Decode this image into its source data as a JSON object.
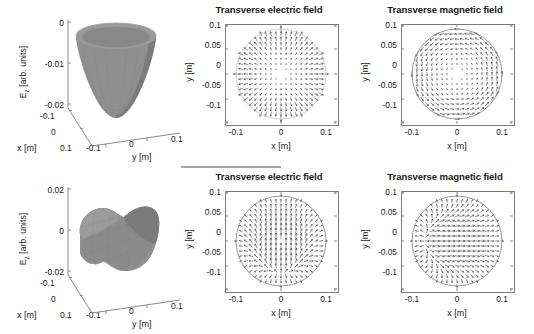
{
  "figure": {
    "background": "#ffffff",
    "surface_color": "#8c8c8c",
    "arrow_color": "#4d4d4d",
    "axis_color": "#7a7a7a"
  },
  "panels": [
    {
      "id": "tm01-ez-surface",
      "kind": "surface3d",
      "zlabel_main": "E",
      "zlabel_sub": "z",
      "zlabel_tail": " [arb. units]",
      "xlabel": "x [m]",
      "ylabel": "y [m]",
      "zticks": [
        "0",
        "-0.01",
        "-0.02"
      ],
      "xticks": [
        "-0.1",
        "0",
        "0.1"
      ],
      "yticks": [
        "-0.1",
        "0",
        "0.1"
      ],
      "shape": "bowl"
    },
    {
      "id": "tm01-transverse-electric",
      "kind": "quiver",
      "title": "Transverse electric field",
      "xlabel": "x [m]",
      "ylabel": "y [m]",
      "yticks": [
        "0.1",
        "0.05",
        "0",
        "-0.05",
        "-0.1"
      ],
      "xticks": [
        "-0.1",
        "0",
        "0.1"
      ],
      "pattern": "radial"
    },
    {
      "id": "tm01-transverse-magnetic",
      "kind": "quiver",
      "title": "Transverse magnetic field",
      "xlabel": "x [m]",
      "ylabel": "y [m]",
      "yticks": [
        "0.1",
        "0.05",
        "0",
        "-0.05",
        "-0.1"
      ],
      "xticks": [
        "-0.1",
        "0",
        "0.1"
      ],
      "pattern": "azimuthal"
    },
    {
      "id": "tm11-ez-surface",
      "kind": "surface3d",
      "zlabel_main": "E",
      "zlabel_sub": "z",
      "zlabel_tail": " [arb. units]",
      "xlabel": "x [m]",
      "ylabel": "y [m]",
      "zticks": [
        "0.02",
        "0",
        "-0.02"
      ],
      "xticks": [
        "-0.1",
        "0",
        "0.1"
      ],
      "yticks": [
        "-0.1",
        "0",
        "0.1"
      ],
      "shape": "saddle"
    },
    {
      "id": "tm11-transverse-electric",
      "kind": "quiver",
      "title": "Transverse electric field",
      "xlabel": "x [m]",
      "ylabel": "y [m]",
      "yticks": [
        "0.1",
        "0.05",
        "0",
        "-0.05",
        "-0.1"
      ],
      "xticks": [
        "-0.1",
        "0",
        "0.1"
      ],
      "pattern": "vertical-dipole"
    },
    {
      "id": "tm11-transverse-magnetic",
      "kind": "quiver",
      "title": "Transverse magnetic field",
      "xlabel": "x [m]",
      "ylabel": "y [m]",
      "yticks": [
        "0.1",
        "0.05",
        "0",
        "-0.05",
        "-0.1"
      ],
      "xticks": [
        "-0.1",
        "0",
        "0.1"
      ],
      "pattern": "horizontal-dipole"
    }
  ],
  "chart_data": {
    "type": "scatter",
    "title": "",
    "subplots": [
      {
        "name": "tm01-ez-surface",
        "type": "surface",
        "xlabel": "x [m]",
        "ylabel": "y [m]",
        "zlabel": "E_z [arb. units]",
        "xlim": [
          -0.1,
          0.1
        ],
        "ylim": [
          -0.1,
          0.1
        ],
        "zlim": [
          -0.02,
          0
        ],
        "xticks": [
          -0.1,
          0,
          0.1
        ],
        "yticks": [
          -0.1,
          0,
          0.1
        ],
        "zticks": [
          0,
          -0.01,
          -0.02
        ],
        "description": "Axially symmetric bowl / inverted-cone surface; E_z maximal (0) at the rim r=0.1 and minimum -0.02 at the centre r=0 — TM01 longitudinal field",
        "grid": false,
        "legend": false
      },
      {
        "name": "tm01-transverse-electric",
        "type": "quiver",
        "title": "Transverse electric field",
        "xlabel": "x [m]",
        "ylabel": "y [m]",
        "xlim": [
          -0.12,
          0.12
        ],
        "ylim": [
          -0.12,
          0.12
        ],
        "xticks": [
          -0.1,
          0,
          0.1
        ],
        "yticks": [
          -0.1,
          -0.05,
          0,
          0.05,
          0.1
        ],
        "field": "radial outward, magnitude ~J1(k r) rising from 0 at centre to maximum at boundary r=0.1",
        "grid": false,
        "legend": false
      },
      {
        "name": "tm01-transverse-magnetic",
        "type": "quiver",
        "title": "Transverse magnetic field",
        "xlabel": "x [m]",
        "ylabel": "y [m]",
        "xlim": [
          -0.12,
          0.12
        ],
        "ylim": [
          -0.12,
          0.12
        ],
        "xticks": [
          -0.1,
          0,
          0.1
        ],
        "yticks": [
          -0.1,
          -0.05,
          0,
          0.05,
          0.1
        ],
        "field": "azimuthal (counter-clockwise), magnitude ~J1(k r), zero at centre, maximum near r=0.1",
        "grid": false,
        "legend": false
      },
      {
        "name": "tm11-ez-surface",
        "type": "surface",
        "xlabel": "x [m]",
        "ylabel": "y [m]",
        "zlabel": "E_z [arb. units]",
        "xlim": [
          -0.1,
          0.1
        ],
        "ylim": [
          -0.1,
          0.1
        ],
        "zlim": [
          -0.02,
          0.02
        ],
        "xticks": [
          -0.1,
          0,
          0.1
        ],
        "yticks": [
          -0.1,
          0,
          0.1
        ],
        "zticks": [
          0.02,
          0,
          -0.02
        ],
        "description": "Dipolar saddle surface; E_z = +0.02 lobe on one side, -0.02 lobe on the opposite side, nodal line through the centre — TM11 longitudinal field",
        "grid": false,
        "legend": false
      },
      {
        "name": "tm11-transverse-electric",
        "type": "quiver",
        "title": "Transverse electric field",
        "xlabel": "x [m]",
        "ylabel": "y [m]",
        "xlim": [
          -0.12,
          0.12
        ],
        "ylim": [
          -0.12,
          0.12
        ],
        "xticks": [
          -0.1,
          0,
          0.1
        ],
        "yticks": [
          -0.1,
          -0.05,
          0,
          0.05,
          0.1
        ],
        "field": "predominantly +y directed in the core, fanning outward toward the disc boundary — TM11 transverse electric pattern",
        "grid": false,
        "legend": false
      },
      {
        "name": "tm11-transverse-magnetic",
        "type": "quiver",
        "title": "Transverse magnetic field",
        "xlabel": "x [m]",
        "ylabel": "y [m]",
        "xlim": [
          -0.12,
          0.12
        ],
        "ylim": [
          -0.12,
          0.12
        ],
        "xticks": [
          -0.1,
          0,
          0.1
        ],
        "yticks": [
          -0.1,
          -0.05,
          0,
          0.05,
          0.1
        ],
        "field": "predominantly +x directed in the core, curving around the disc boundary — TM11 transverse magnetic pattern, orthogonal to the electric pattern",
        "grid": false,
        "legend": false
      }
    ]
  }
}
